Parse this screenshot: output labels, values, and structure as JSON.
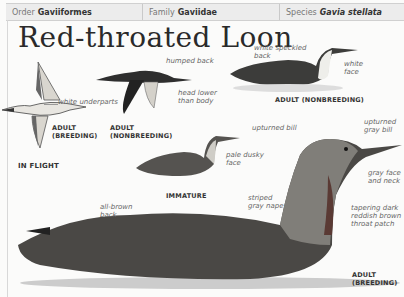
{
  "header": {
    "order": {
      "label": "Order",
      "value": "Gaviiformes"
    },
    "family": {
      "label": "Family",
      "value": "Gaviidae"
    },
    "species": {
      "label": "Species",
      "value": "Gavia stellata"
    }
  },
  "title": "Red-throated Loon",
  "illustrations": {
    "flight_breeding": {
      "caption_1": "ADULT",
      "caption_2": "(BREEDING)",
      "annotation": "white underparts"
    },
    "flight_nonbreeding": {
      "caption_1": "ADULT",
      "caption_2": "(NONBREEDING)",
      "annotation_1": "humped back",
      "annotation_2a": "head lower",
      "annotation_2b": "than body"
    },
    "in_flight_label": "IN FLIGHT",
    "adult_nonbreeding": {
      "caption": "ADULT (NONBREEDING)",
      "annotation_1a": "white speckled",
      "annotation_1b": "back",
      "annotation_2a": "white",
      "annotation_2b": "face"
    },
    "immature": {
      "caption": "IMMATURE",
      "annotation_1": "upturned bill",
      "annotation_2a": "pale dusky",
      "annotation_2b": "face"
    },
    "adult_breeding": {
      "caption_1": "ADULT",
      "caption_2": "(BREEDING)",
      "annotation_bill_a": "upturned",
      "annotation_bill_b": "gray bill",
      "annotation_face_a": "gray face",
      "annotation_face_b": "and neck",
      "annotation_throat_a": "tapering dark",
      "annotation_throat_b": "reddish brown",
      "annotation_throat_c": "throat patch",
      "annotation_nape_a": "striped",
      "annotation_nape_b": "gray nape",
      "annotation_back_a": "all-brown",
      "annotation_back_b": "back"
    }
  },
  "colors": {
    "header_bg": "#ececec",
    "page_bg": "#fbfbfa",
    "text_dark": "#2a2a2a",
    "annotation": "#666666"
  }
}
